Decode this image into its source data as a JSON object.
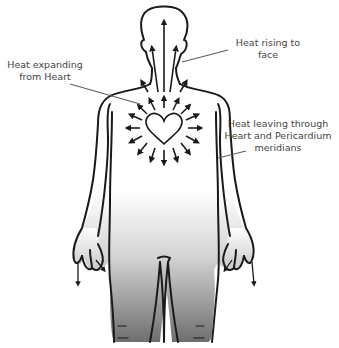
{
  "diagram": {
    "colors": {
      "outline": "#1a1a1a",
      "leader_line": "#555555",
      "label_text": "#444444",
      "shade_dark": "#6e6e6e",
      "shade_light": "#ffffff"
    },
    "labels": [
      {
        "id": "heat-expanding",
        "lines": [
          "Heat expanding",
          "from Heart"
        ]
      },
      {
        "id": "heat-rising",
        "lines": [
          "Heat rising to",
          "face"
        ]
      },
      {
        "id": "heat-leaving",
        "lines": [
          "Heat leaving through",
          "Heart and Pericardium",
          "meridians"
        ]
      }
    ],
    "elements": {
      "heart": "heart-outline-icon",
      "radiating_arrows": 16,
      "rising_arrows_to_face": 5,
      "hand_arrows": 4
    }
  }
}
